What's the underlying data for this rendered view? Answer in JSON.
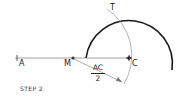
{
  "diagram": {
    "step_label": "STEP 2",
    "points": {
      "A": {
        "label": "A",
        "x": 17,
        "y": 58
      },
      "M": {
        "label": "M",
        "x": 73,
        "y": 58
      },
      "C": {
        "label": "C",
        "x": 129,
        "y": 58
      },
      "T": {
        "label": "T",
        "x": 114,
        "y": 11
      }
    },
    "radius_label": {
      "numerator": "AC",
      "denominator": "2"
    },
    "colors": {
      "heavy_arc": "#1a1a1a",
      "construction": "#999999",
      "segment": "#888888",
      "text": "#222222"
    }
  }
}
